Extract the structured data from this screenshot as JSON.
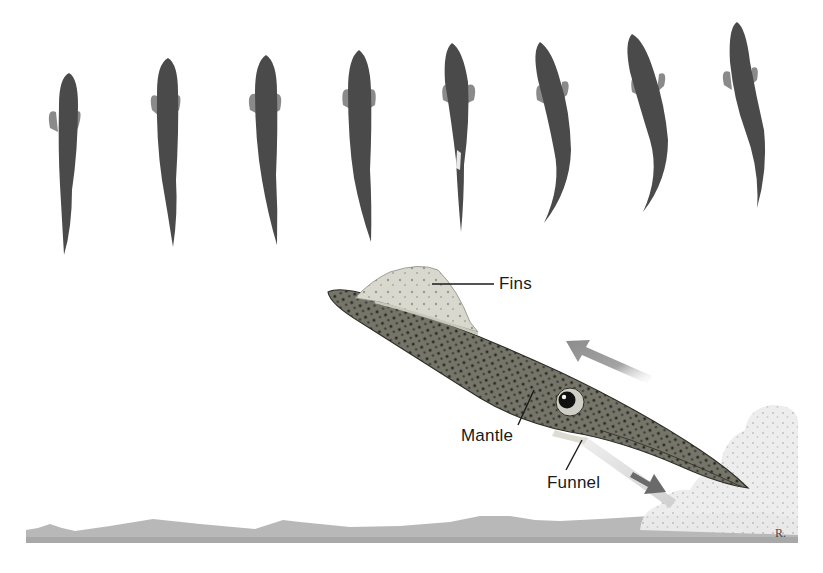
{
  "figure": {
    "colors": {
      "background": "#ffffff",
      "body_dark": "#4a4a4a",
      "fin_gray": "#8a8a8a",
      "squid_body": "#6e6e62",
      "squid_fin": "#d6d6cc",
      "arrow_gray": "#9a9a9a",
      "arrow_dark": "#6a6a6a",
      "seabed": "#b4b4b4",
      "ink_cloud": "#e6e6e6",
      "label_text": "#1a1a1a"
    },
    "sequence": {
      "count": 8,
      "direction": "top view, swimming upward"
    },
    "labels": {
      "fins": "Fins",
      "mantle": "Mantle",
      "funnel": "Funnel"
    },
    "arrows": {
      "motion": "squid moves up-left",
      "jet": "water jet expelled down-right from funnel"
    },
    "signature": "R."
  }
}
